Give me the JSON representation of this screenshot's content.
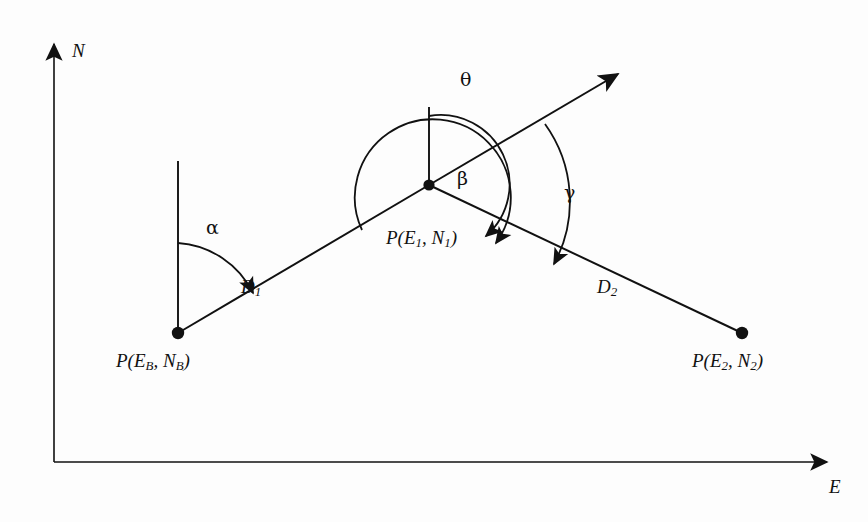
{
  "figure": {
    "background_color": "#fdfdfd",
    "stroke_color": "#111111"
  },
  "axes": {
    "north_label": "N",
    "east_label": "E",
    "origin": {
      "x": 54,
      "y": 462
    },
    "north_tip": {
      "x": 54,
      "y": 38
    },
    "east_tip": {
      "x": 833,
      "y": 462
    }
  },
  "points": [
    {
      "id": "base",
      "label_prefix": "P",
      "label_open": "(",
      "label_e": "E",
      "label_e_sub": "B",
      "label_comma": ",",
      "label_n": "N",
      "label_n_sub": "B",
      "label_close": ")",
      "label_plain": "P(E_B, N_B)",
      "x": 178,
      "y": 333
    },
    {
      "id": "station1",
      "label_prefix": "P",
      "label_open": "(",
      "label_e": "E",
      "label_e_sub": "1",
      "label_comma": ",",
      "label_n": "N",
      "label_n_sub": "1",
      "label_close": ")",
      "label_plain": "P(E_1, N_1)",
      "x": 429,
      "y": 185
    },
    {
      "id": "station2",
      "label_prefix": "P",
      "label_open": "(",
      "label_e": "E",
      "label_e_sub": "2",
      "label_comma": ",",
      "label_n": "N",
      "label_n_sub": "2",
      "label_close": ")",
      "label_plain": "P(E_2, N_2)",
      "x": 742,
      "y": 333
    }
  ],
  "distances": [
    {
      "id": "d1",
      "label_main": "D",
      "label_sub": "1",
      "label_plain": "D_1",
      "label_x": 248,
      "label_y": 286
    },
    {
      "id": "d2",
      "label_main": "D",
      "label_sub": "2",
      "label_plain": "D_2",
      "label_x": 604,
      "label_y": 286
    }
  ],
  "angles": [
    {
      "id": "alpha",
      "symbol": "α",
      "name": "alpha",
      "description": "whole-circle bearing of D1 from north at base point",
      "vertex": "base",
      "label_x": 212,
      "label_y": 226
    },
    {
      "id": "beta",
      "symbol": "β",
      "name": "beta",
      "description": "deflection angle from forward prolongation of D1 to D2",
      "vertex": "station1",
      "label_x": 463,
      "label_y": 178
    },
    {
      "id": "theta",
      "symbol": "θ",
      "name": "theta",
      "description": "clockwise angle from back bearing of D1 around to D2",
      "vertex": "station1",
      "label_x": 466,
      "label_y": 79
    },
    {
      "id": "gamma",
      "symbol": "γ",
      "name": "gamma",
      "description": "angle from forward ray to D2",
      "vertex": "station1",
      "label_x": 570,
      "label_y": 192
    }
  ],
  "north_lines": [
    {
      "id": "north-at-base",
      "x": 178,
      "y_top": 161,
      "y_bottom": 333
    },
    {
      "id": "north-at-station1",
      "x": 429,
      "y_top": 107,
      "y_bottom": 185
    }
  ],
  "forward_ray": {
    "id": "forward-ray",
    "from": {
      "x": 429,
      "y": 185
    },
    "to": {
      "x": 625,
      "y": 70
    },
    "has_arrowhead": true
  }
}
